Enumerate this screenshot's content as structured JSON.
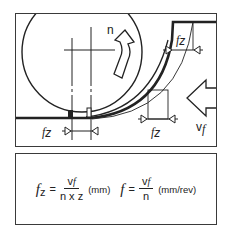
{
  "diagram": {
    "labels": {
      "rotation": "n",
      "feed_per_tooth_top": "f",
      "feed_per_tooth_top_sub": "z",
      "feed_per_tooth_bottom_left": "f",
      "feed_per_tooth_bottom_left_sub": "z",
      "feed_per_tooth_bottom_mid": "f",
      "feed_per_tooth_bottom_mid_sub": "z",
      "feed_velocity": "v",
      "feed_velocity_sub": "f"
    },
    "colors": {
      "line": "#222222",
      "background": "#ffffff"
    }
  },
  "formulas": {
    "feed_per_tooth": {
      "lhs": "f",
      "lhs_sub": "z",
      "equals": "=",
      "numerator": "v",
      "numerator_sub": "f",
      "denominator": "n x z",
      "unit": "(mm)"
    },
    "feed_per_rev": {
      "lhs": "f",
      "equals": "=",
      "numerator": "v",
      "numerator_sub": "f",
      "denominator": "n",
      "unit": "(mm/rev)"
    }
  }
}
